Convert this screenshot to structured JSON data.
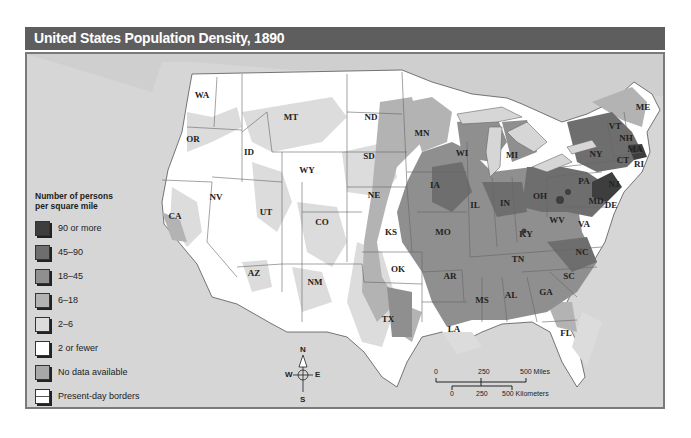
{
  "title": "United States Population Density, 1890",
  "legend": {
    "title_line1": "Number of persons",
    "title_line2": "per square mile",
    "items": [
      {
        "label": "90 or more",
        "color": "#3e3e3e"
      },
      {
        "label": "45–90",
        "color": "#6e6e6e"
      },
      {
        "label": "18–45",
        "color": "#8f8f8f"
      },
      {
        "label": "6–18",
        "color": "#b3b3b3"
      },
      {
        "label": "2–6",
        "color": "#dcdcdc"
      },
      {
        "label": "2 or fewer",
        "color": "#ffffff"
      },
      {
        "label": "No data available",
        "color": "#a8a8a8"
      },
      {
        "label": "Present-day borders",
        "color": "#ffffff"
      }
    ]
  },
  "compass": {
    "n": "N",
    "s": "S",
    "e": "E",
    "w": "W"
  },
  "scale": {
    "miles_0": "0",
    "miles_250": "250",
    "miles_500": "500 Miles",
    "km_0": "0",
    "km_250": "250",
    "km_500": "500 Kilometers"
  },
  "states": [
    {
      "abbr": "WA",
      "x": 202,
      "y": 95
    },
    {
      "abbr": "OR",
      "x": 193,
      "y": 139
    },
    {
      "abbr": "ID",
      "x": 249,
      "y": 152
    },
    {
      "abbr": "MT",
      "x": 291,
      "y": 117
    },
    {
      "abbr": "WY",
      "x": 307,
      "y": 170
    },
    {
      "abbr": "ND",
      "x": 371,
      "y": 117
    },
    {
      "abbr": "SD",
      "x": 369,
      "y": 156
    },
    {
      "abbr": "NE",
      "x": 374,
      "y": 195
    },
    {
      "abbr": "NV",
      "x": 216,
      "y": 197
    },
    {
      "abbr": "UT",
      "x": 266,
      "y": 212
    },
    {
      "abbr": "CO",
      "x": 322,
      "y": 222
    },
    {
      "abbr": "CA",
      "x": 175,
      "y": 216
    },
    {
      "abbr": "AZ",
      "x": 254,
      "y": 273
    },
    {
      "abbr": "NM",
      "x": 315,
      "y": 282
    },
    {
      "abbr": "MN",
      "x": 422,
      "y": 133
    },
    {
      "abbr": "WI",
      "x": 462,
      "y": 153
    },
    {
      "abbr": "MI",
      "x": 512,
      "y": 155
    },
    {
      "abbr": "IA",
      "x": 435,
      "y": 185
    },
    {
      "abbr": "IL",
      "x": 475,
      "y": 205
    },
    {
      "abbr": "IN",
      "x": 505,
      "y": 203
    },
    {
      "abbr": "OH",
      "x": 540,
      "y": 196
    },
    {
      "abbr": "PA",
      "x": 584,
      "y": 181
    },
    {
      "abbr": "NY",
      "x": 596,
      "y": 154
    },
    {
      "abbr": "VT",
      "x": 615,
      "y": 126
    },
    {
      "abbr": "NH",
      "x": 626,
      "y": 138
    },
    {
      "abbr": "ME",
      "x": 643,
      "y": 107
    },
    {
      "abbr": "MA",
      "x": 635,
      "y": 149
    },
    {
      "abbr": "CT",
      "x": 623,
      "y": 160
    },
    {
      "abbr": "RI",
      "x": 639,
      "y": 164
    },
    {
      "abbr": "NJ",
      "x": 614,
      "y": 184
    },
    {
      "abbr": "MD",
      "x": 596,
      "y": 201
    },
    {
      "abbr": "DE",
      "x": 611,
      "y": 205
    },
    {
      "abbr": "WV",
      "x": 557,
      "y": 220
    },
    {
      "abbr": "VA",
      "x": 584,
      "y": 224
    },
    {
      "abbr": "KY",
      "x": 526,
      "y": 234
    },
    {
      "abbr": "MO",
      "x": 443,
      "y": 232
    },
    {
      "abbr": "KS",
      "x": 391,
      "y": 232
    },
    {
      "abbr": "OK",
      "x": 398,
      "y": 269
    },
    {
      "abbr": "AR",
      "x": 450,
      "y": 276
    },
    {
      "abbr": "TN",
      "x": 518,
      "y": 259
    },
    {
      "abbr": "NC",
      "x": 582,
      "y": 252
    },
    {
      "abbr": "SC",
      "x": 569,
      "y": 276
    },
    {
      "abbr": "GA",
      "x": 546,
      "y": 292
    },
    {
      "abbr": "AL",
      "x": 511,
      "y": 295
    },
    {
      "abbr": "MS",
      "x": 482,
      "y": 300
    },
    {
      "abbr": "LA",
      "x": 454,
      "y": 329
    },
    {
      "abbr": "TX",
      "x": 388,
      "y": 319
    },
    {
      "abbr": "FL",
      "x": 566,
      "y": 333
    }
  ]
}
